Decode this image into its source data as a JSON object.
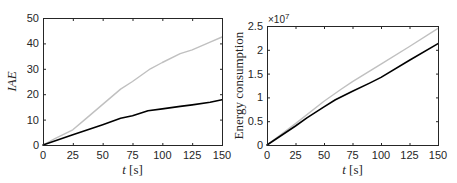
{
  "chart_data": [
    {
      "type": "line",
      "title": "",
      "xlabel": "t [s]",
      "ylabel": "IAE",
      "xlim": [
        0,
        150
      ],
      "ylim": [
        0,
        50
      ],
      "xticks": [
        0,
        25,
        50,
        75,
        100,
        125,
        150
      ],
      "yticks": [
        0,
        10,
        20,
        30,
        40,
        50
      ],
      "xtick_labels": [
        "0",
        "25",
        "50",
        "75",
        "100",
        "125",
        "150"
      ],
      "ytick_labels": [
        "0",
        "10",
        "20",
        "30",
        "40",
        "50"
      ],
      "grid": false,
      "legend": null,
      "series": [
        {
          "name": "gray",
          "color": "#c0c0c0",
          "x": [
            0,
            10,
            25,
            35,
            50,
            65,
            75,
            90,
            100,
            115,
            125,
            140,
            150
          ],
          "y": [
            0,
            2.5,
            6,
            10,
            16,
            22,
            25,
            30,
            32.5,
            36,
            37.5,
            40.5,
            42.5
          ]
        },
        {
          "name": "black",
          "color": "#000000",
          "x": [
            0,
            25,
            50,
            65,
            75,
            88,
            100,
            115,
            125,
            140,
            150
          ],
          "y": [
            0,
            4,
            8,
            10.5,
            11.5,
            13.5,
            14.2,
            15.2,
            15.8,
            16.8,
            17.8
          ]
        }
      ]
    },
    {
      "type": "line",
      "title": "",
      "xlabel": "t [s]",
      "ylabel": "Energy consumption",
      "axis_multiplier": "×10",
      "axis_exponent": "7",
      "xlim": [
        0,
        150
      ],
      "ylim": [
        0,
        2.5
      ],
      "xticks": [
        0,
        25,
        50,
        75,
        100,
        125,
        150
      ],
      "yticks": [
        0,
        0.5,
        1,
        1.5,
        2,
        2.5
      ],
      "xtick_labels": [
        "0",
        "25",
        "50",
        "75",
        "100",
        "125",
        "150"
      ],
      "ytick_labels": [
        "0",
        "0.5",
        "1",
        "1.5",
        "2",
        "2.5"
      ],
      "grid": false,
      "legend": null,
      "series": [
        {
          "name": "gray",
          "color": "#c0c0c0",
          "x": [
            0,
            25,
            50,
            65,
            75,
            100,
            125,
            150
          ],
          "y": [
            0,
            0.45,
            0.92,
            1.17,
            1.33,
            1.7,
            2.07,
            2.45
          ]
        },
        {
          "name": "black",
          "color": "#000000",
          "x": [
            0,
            25,
            35,
            50,
            60,
            75,
            90,
            100,
            125,
            150
          ],
          "y": [
            0,
            0.4,
            0.57,
            0.8,
            0.95,
            1.13,
            1.3,
            1.42,
            1.78,
            2.13
          ]
        }
      ]
    }
  ]
}
